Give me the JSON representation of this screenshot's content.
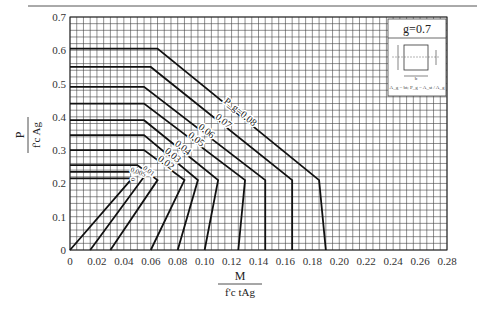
{
  "chart_data": {
    "type": "line",
    "title": "g=0.7",
    "xlabel": "M / (f'c t A_g)",
    "ylabel": "P / (f'c A_g)",
    "xlim": [
      0,
      0.28
    ],
    "ylim": [
      0,
      0.7
    ],
    "grid": true,
    "x_ticks": [
      "0",
      "0.02",
      "0.04",
      "0.06",
      "0.08",
      "0.10",
      "0.12",
      "0.14",
      "0.16",
      "0.18",
      "0.20",
      "0.22",
      "0.24",
      "0.26",
      "0.28"
    ],
    "y_ticks": [
      "0",
      "0.1",
      "0.2",
      "0.3",
      "0.4",
      "0.5",
      "0.6",
      "0.7"
    ],
    "legend_note": "A_g = bt; P_g = A_st / A_g",
    "series": [
      {
        "name": "0",
        "label": "0",
        "points": [
          [
            0,
            0
          ],
          [
            0.045,
            0.21
          ],
          [
            0.045,
            0.215
          ],
          [
            0,
            0.215
          ]
        ]
      },
      {
        "name": "0.005",
        "label": "0.005",
        "points": [
          [
            0.015,
            0
          ],
          [
            0.055,
            0.22
          ],
          [
            0.045,
            0.235
          ],
          [
            0,
            0.235
          ]
        ]
      },
      {
        "name": "0.01",
        "label": "0.01",
        "points": [
          [
            0.03,
            0
          ],
          [
            0.065,
            0.21
          ],
          [
            0.05,
            0.255
          ],
          [
            0,
            0.255
          ]
        ]
      },
      {
        "name": "0.02",
        "label": "0.02",
        "points": [
          [
            0.06,
            0
          ],
          [
            0.085,
            0.21
          ],
          [
            0.055,
            0.3
          ],
          [
            0,
            0.3
          ]
        ]
      },
      {
        "name": "0.03",
        "label": "0.03",
        "points": [
          [
            0.08,
            0
          ],
          [
            0.095,
            0.21
          ],
          [
            0.055,
            0.345
          ],
          [
            0,
            0.345
          ]
        ]
      },
      {
        "name": "0.04",
        "label": "0.04",
        "points": [
          [
            0.1,
            0
          ],
          [
            0.11,
            0.21
          ],
          [
            0.055,
            0.39
          ],
          [
            0,
            0.39
          ]
        ]
      },
      {
        "name": "0.05",
        "label": "0.05",
        "points": [
          [
            0.125,
            0
          ],
          [
            0.13,
            0.21
          ],
          [
            0.055,
            0.44
          ],
          [
            0,
            0.44
          ]
        ]
      },
      {
        "name": "0.06",
        "label": "0.06",
        "points": [
          [
            0.145,
            0
          ],
          [
            0.145,
            0.21
          ],
          [
            0.055,
            0.49
          ],
          [
            0,
            0.49
          ]
        ]
      },
      {
        "name": "0.07",
        "label": "0.07",
        "points": [
          [
            0.165,
            0
          ],
          [
            0.165,
            0.21
          ],
          [
            0.06,
            0.55
          ],
          [
            0,
            0.55
          ]
        ]
      },
      {
        "name": "0.08",
        "label": "P_g=0.08",
        "points": [
          [
            0.19,
            0
          ],
          [
            0.185,
            0.21
          ],
          [
            0.065,
            0.605
          ],
          [
            0,
            0.605
          ]
        ]
      }
    ]
  }
}
